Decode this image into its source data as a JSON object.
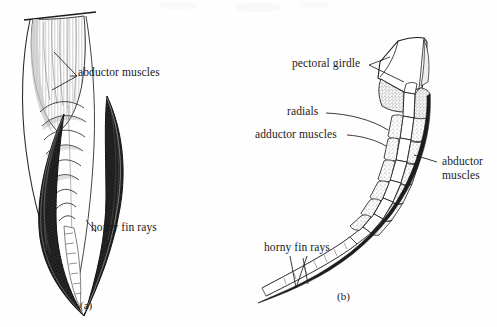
{
  "figure": {
    "type": "anatomical-illustration",
    "panels": [
      {
        "id": "a",
        "caption": "(a)",
        "description": "External/superficial view of a fin showing abductor muscles and horny fin rays",
        "labels": [
          {
            "id": "abductor-muscles",
            "text": "abductor muscles"
          },
          {
            "id": "horny-fin-rays",
            "text": "horny fin rays"
          }
        ]
      },
      {
        "id": "b",
        "caption": "(b)",
        "description": "Sectioned/skeletal view of a fin showing pectoral girdle, radials, adductor and abductor muscles and horny fin rays",
        "labels": [
          {
            "id": "pectoral-girdle",
            "text": "pectoral girdle"
          },
          {
            "id": "radials",
            "text": "radials"
          },
          {
            "id": "adductor-muscles",
            "text": "adductor muscles"
          },
          {
            "id": "abductor-muscles",
            "text": "abductor\nmuscles"
          },
          {
            "id": "horny-fin-rays",
            "text": "horny fin rays"
          }
        ]
      }
    ],
    "colors": {
      "ink": "#1a1a1a",
      "paper": "#fefefe",
      "shade_dark": "#2b2b2b",
      "shade_mid": "#7a7a7a",
      "shade_light": "#d8d8d8"
    }
  }
}
